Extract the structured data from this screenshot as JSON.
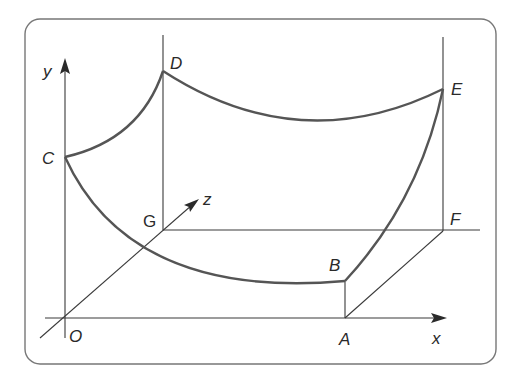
{
  "diagram": {
    "type": "3d-coordinate-surface-sketch",
    "colors": {
      "frame": "#777777",
      "axes": "#3a3a3a",
      "curve": "#555555",
      "text": "#2a2a2a"
    },
    "axes": {
      "x": "x",
      "y": "y",
      "z": "z"
    },
    "points": {
      "O": "O",
      "A": "A",
      "B": "B",
      "C": "C",
      "D": "D",
      "E": "E",
      "F": "F",
      "G": "G"
    }
  }
}
